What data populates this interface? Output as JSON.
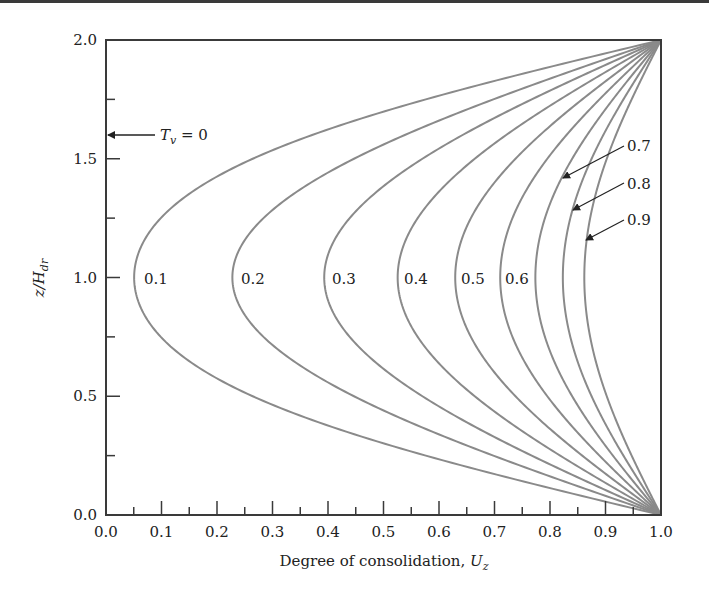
{
  "chart_data": {
    "type": "line",
    "title": "",
    "xlabel": "Degree of consolidation, U_z",
    "xlabel_main": "Degree of consolidation, ",
    "xlabel_var": "U",
    "xlabel_sub": "z",
    "ylabel": "z/H_dr",
    "ylabel_main": "z/H",
    "ylabel_sub": "dr",
    "xlim": [
      0.0,
      1.0
    ],
    "ylim": [
      0.0,
      2.0
    ],
    "x_ticks": [
      "0.0",
      "0.1",
      "0.2",
      "0.3",
      "0.4",
      "0.5",
      "0.6",
      "0.7",
      "0.8",
      "0.9",
      "1.0"
    ],
    "y_ticks": [
      "0.0",
      "0.5",
      "1.0",
      "1.5",
      "2.0"
    ],
    "grid": false,
    "legend": "none (curves labeled inline by T_v)",
    "series_param": "T_v",
    "series": [
      {
        "name": "0.1",
        "min_Uz_at_mid": 0.05
      },
      {
        "name": "0.2",
        "min_Uz_at_mid": 0.23
      },
      {
        "name": "0.3",
        "min_Uz_at_mid": 0.39
      },
      {
        "name": "0.4",
        "min_Uz_at_mid": 0.53
      },
      {
        "name": "0.5",
        "min_Uz_at_mid": 0.63
      },
      {
        "name": "0.6",
        "min_Uz_at_mid": 0.71
      },
      {
        "name": "0.7",
        "min_Uz_at_mid": 0.78
      },
      {
        "name": "0.8",
        "min_Uz_at_mid": 0.82
      },
      {
        "name": "0.9",
        "min_Uz_at_mid": 0.86
      }
    ],
    "annotations": [
      {
        "text": "T_v = 0",
        "points_to": [
          0.0,
          1.6
        ]
      },
      {
        "text": "0.7",
        "arrow": true
      },
      {
        "text": "0.8",
        "arrow": true
      },
      {
        "text": "0.9",
        "arrow": true
      }
    ]
  },
  "labels": {
    "tv0_main": "T",
    "tv0_sub": "v",
    "tv0_rest": " = 0",
    "inline": [
      "0.1",
      "0.2",
      "0.3",
      "0.4",
      "0.5",
      "0.6"
    ],
    "arrowed": [
      "0.7",
      "0.8",
      "0.9"
    ]
  },
  "colors": {
    "axis": "#3a3a3a",
    "curve": "#8a8a8a",
    "text": "#222222"
  }
}
